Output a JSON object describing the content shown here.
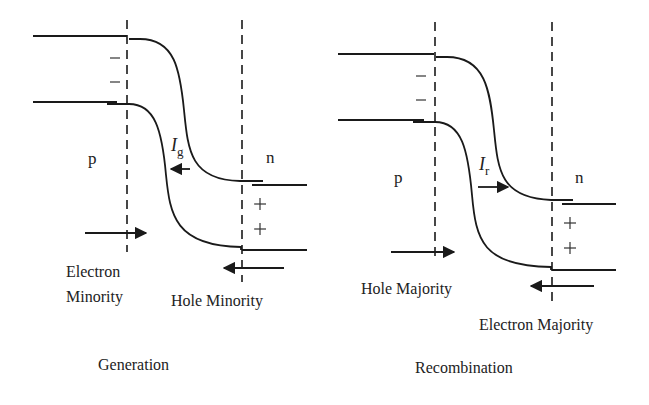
{
  "diagram": {
    "type": "pn-junction-band-diagram",
    "panels": [
      {
        "id": "generation",
        "caption": "Generation",
        "region_left": "p",
        "region_right": "n",
        "current_label_main": "I",
        "current_label_sub": "g",
        "current_direction": "left",
        "depletion_charges_left": [
          "−",
          "−"
        ],
        "depletion_charges_right": [
          "+",
          "+"
        ],
        "arrow_left_label_line1": "Electron",
        "arrow_left_label_line2": "Minority",
        "arrow_left_direction": "right",
        "arrow_right_label": "Hole Minority",
        "arrow_right_direction": "left"
      },
      {
        "id": "recombination",
        "caption": "Recombination",
        "region_left": "p",
        "region_right": "n",
        "current_label_main": "I",
        "current_label_sub": "r",
        "current_direction": "right",
        "depletion_charges_left": [
          "−",
          "−"
        ],
        "depletion_charges_right": [
          "+",
          "+"
        ],
        "arrow_left_label": "Hole Majority",
        "arrow_left_direction": "right",
        "arrow_right_label": "Electron Majority",
        "arrow_right_direction": "left"
      }
    ],
    "colors": {
      "line": "#1a1a1a",
      "text": "#222222",
      "background": "#ffffff"
    }
  }
}
